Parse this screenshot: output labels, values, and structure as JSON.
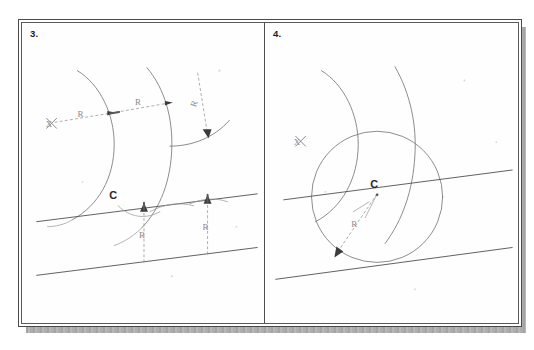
{
  "document": {
    "type": "scanned-technical-drawing-worksheet",
    "top_cut_text": "··········································",
    "background_color": "#ffffff",
    "frame_color": "#4a4a4a",
    "shadow_color": "#b4b4b4",
    "pencil_color": "#787878",
    "ink_color": "#4f4f4f",
    "label_color": "#2a2a2a"
  },
  "panels": [
    {
      "id": "panel-3",
      "number": "3.",
      "description": "Construction of an arc tangent to two given arcs: center locus arcs struck from X, radius R offsets, and a pair of tangent lines with R dimension drops to C.",
      "labels": {
        "center_mark": "X",
        "radius_1": "R",
        "radius_2": "R",
        "radius_3": "R",
        "tangent_point": "C",
        "drop_radius_1": "R",
        "drop_radius_2": "R"
      }
    },
    {
      "id": "panel-4",
      "number": "4.",
      "description": "Completed construction: circle of radius R centered at C tangent to the two given straight lines, with the two locus arcs and center mark X retained.",
      "labels": {
        "center_mark": "X",
        "circle_center": "C",
        "radius": "R"
      }
    }
  ],
  "geometry": {
    "panel3": {
      "arc_left": "large arc, center off-left, passing through mid-panel",
      "arc_mid": "second large arc offset by R to the right",
      "arc_right": "short arc at right receiving R arrow",
      "dimension_line": "dashed line from X through two arrowheads labelled R and R",
      "upper_tangent_line": "inclined straight line crossing panel at mid-height",
      "lower_tangent_line": "inclined straight line near panel bottom, parallel to upper",
      "vertical_drop_1": "dashed vertical with up-arrow labelled R",
      "vertical_drop_2": "dashed vertical with up-arrow labelled R"
    },
    "panel4": {
      "arc_left": "large arc, center off-left",
      "arc_right": "large arc sweeping down from top",
      "circle": "full circle tangent to both straight lines, center C",
      "radius_arrow": "arrow from C to lower-left circumference labelled R",
      "upper_tangent_line": "inclined straight line through C",
      "lower_tangent_line": "inclined straight line tangent to circle bottom"
    }
  }
}
